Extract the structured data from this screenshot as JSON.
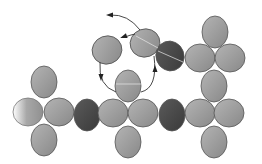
{
  "diagram": {
    "colors": {
      "background": "#ffffff",
      "light_gray": "#a8a8a8",
      "mid_gray": "#8e8e8e",
      "dark_gray": "#4a4a4a",
      "stroke": "#555555",
      "arrow": "#333333"
    },
    "ellipses": [
      {
        "id": "left-top",
        "cx": 44,
        "cy": 82,
        "rx": 13,
        "ry": 16,
        "rot": 0,
        "tone": "light"
      },
      {
        "id": "left-left",
        "cx": 28,
        "cy": 112,
        "rx": 15,
        "ry": 14,
        "rot": 0,
        "tone": "fade"
      },
      {
        "id": "left-right",
        "cx": 59,
        "cy": 112,
        "rx": 15,
        "ry": 14,
        "rot": 0,
        "tone": "light"
      },
      {
        "id": "left-bottom",
        "cx": 44,
        "cy": 140,
        "rx": 13,
        "ry": 16,
        "rot": 0,
        "tone": "light"
      },
      {
        "id": "dark-left",
        "cx": 87,
        "cy": 115,
        "rx": 13,
        "ry": 16,
        "rot": 0,
        "tone": "dark"
      },
      {
        "id": "center-top",
        "cx": 128,
        "cy": 86,
        "rx": 13,
        "ry": 16,
        "rot": 0,
        "tone": "light"
      },
      {
        "id": "center-left",
        "cx": 113,
        "cy": 113,
        "rx": 15,
        "ry": 14,
        "rot": 0,
        "tone": "light"
      },
      {
        "id": "center-right",
        "cx": 143,
        "cy": 113,
        "rx": 15,
        "ry": 14,
        "rot": 0,
        "tone": "light"
      },
      {
        "id": "center-bottom",
        "cx": 128,
        "cy": 142,
        "rx": 13,
        "ry": 16,
        "rot": 0,
        "tone": "light"
      },
      {
        "id": "dark-right",
        "cx": 172,
        "cy": 115,
        "rx": 13,
        "ry": 16,
        "rot": 0,
        "tone": "dark"
      },
      {
        "id": "float-left",
        "cx": 107,
        "cy": 50,
        "rx": 15,
        "ry": 14,
        "rot": -20,
        "tone": "light"
      },
      {
        "id": "float-mid",
        "cx": 145,
        "cy": 43,
        "rx": 15,
        "ry": 14,
        "rot": -20,
        "tone": "light"
      },
      {
        "id": "dark-upper",
        "cx": 170,
        "cy": 56,
        "rx": 14,
        "ry": 15,
        "rot": -20,
        "tone": "dark"
      },
      {
        "id": "right-top",
        "cx": 215,
        "cy": 32,
        "rx": 13,
        "ry": 16,
        "rot": 0,
        "tone": "light"
      },
      {
        "id": "right-upper-left",
        "cx": 200,
        "cy": 58,
        "rx": 15,
        "ry": 14,
        "rot": 0,
        "tone": "light"
      },
      {
        "id": "right-upper-right",
        "cx": 230,
        "cy": 58,
        "rx": 15,
        "ry": 14,
        "rot": 0,
        "tone": "light"
      },
      {
        "id": "right-mid",
        "cx": 214,
        "cy": 86,
        "rx": 13,
        "ry": 16,
        "rot": 0,
        "tone": "light"
      },
      {
        "id": "right-lower-left",
        "cx": 200,
        "cy": 113,
        "rx": 15,
        "ry": 14,
        "rot": 0,
        "tone": "light"
      },
      {
        "id": "right-lower-right",
        "cx": 229,
        "cy": 113,
        "rx": 15,
        "ry": 14,
        "rot": 0,
        "tone": "light"
      },
      {
        "id": "right-bottom",
        "cx": 214,
        "cy": 142,
        "rx": 13,
        "ry": 16,
        "rot": 0,
        "tone": "light"
      }
    ],
    "highlight_lines": [
      {
        "x1": 116,
        "y1": 84,
        "x2": 141,
        "y2": 84
      },
      {
        "x1": 158,
        "y1": 51,
        "x2": 183,
        "y2": 62
      },
      {
        "x1": 136,
        "y1": 36,
        "x2": 158,
        "y2": 48
      }
    ],
    "arrows": [
      {
        "id": "arrow-top-out",
        "d": "M 140 30 Q 128 14 110 15",
        "head": {
          "x": 109,
          "y": 15,
          "angle": 180
        }
      },
      {
        "id": "arrow-top-in",
        "d": "M 135 34 Q 130 35 125 37",
        "head": {
          "x": 123,
          "y": 37,
          "angle": 160
        }
      },
      {
        "id": "arrow-left-down",
        "d": "M 100 62 Q 98 86 116 92",
        "head": {
          "x": 101,
          "y": 78,
          "angle": 90
        }
      },
      {
        "id": "arrow-right-up",
        "d": "M 141 92 Q 158 88 154 56",
        "head": {
          "x": 155,
          "y": 68,
          "angle": -90
        }
      }
    ]
  }
}
